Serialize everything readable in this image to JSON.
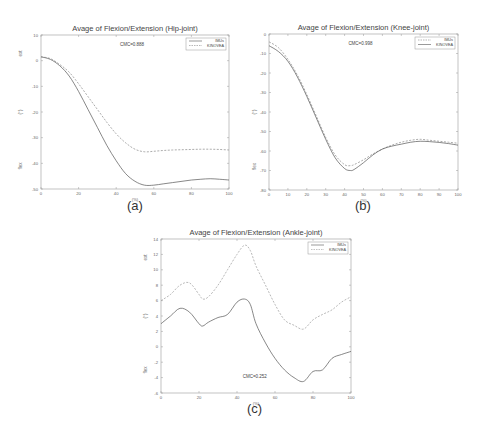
{
  "chart_data": [
    {
      "type": "line",
      "id": "hip",
      "title": "Avage of Flexion/Extension (Hip-joint)",
      "subfigure_label": "(a)",
      "xlabel": "(%)",
      "ylabel_parts": [
        "ext",
        "(°)",
        "flex"
      ],
      "annotation": "CMC=0.888",
      "xlim": [
        0,
        100
      ],
      "ylim": [
        -50,
        10
      ],
      "xticks": [
        0,
        20,
        40,
        60,
        80,
        100
      ],
      "yticks": [
        10,
        0,
        -10,
        -20,
        -30,
        -40,
        -50
      ],
      "grid": false,
      "legend_position": "upper right",
      "x": [
        0,
        5,
        10,
        15,
        20,
        25,
        30,
        35,
        40,
        45,
        50,
        55,
        60,
        65,
        70,
        75,
        80,
        85,
        90,
        95,
        100
      ],
      "series": [
        {
          "name": "IMUs",
          "color": "#555555",
          "dash": "none",
          "values": [
            1.5,
            0.5,
            -2,
            -6,
            -12,
            -19,
            -26,
            -33,
            -39,
            -44,
            -47,
            -48.5,
            -48.5,
            -48,
            -47.5,
            -47,
            -46.5,
            -46.2,
            -46,
            -46.2,
            -46.5
          ]
        },
        {
          "name": "KINOVEA",
          "color": "#888888",
          "dash": "2,1.5",
          "values": [
            1.5,
            0.8,
            -1.5,
            -4.5,
            -9,
            -14,
            -19,
            -24,
            -28.5,
            -32,
            -34.5,
            -35.5,
            -35.3,
            -35,
            -34.8,
            -34.7,
            -34.6,
            -34.5,
            -34.5,
            -34.6,
            -34.8
          ]
        }
      ]
    },
    {
      "type": "line",
      "id": "knee",
      "title": "Avage of Flexion/Extension (Knee-joint)",
      "subfigure_label": "(b)",
      "xlabel": "(%)",
      "ylabel_parts": [
        "(°)",
        "flex"
      ],
      "annotation": "CMC=0.998",
      "xlim": [
        0,
        100
      ],
      "ylim": [
        -80,
        0
      ],
      "xticks": [
        0,
        10,
        20,
        30,
        40,
        50,
        60,
        70,
        80,
        90,
        100
      ],
      "yticks": [
        0,
        -10,
        -20,
        -30,
        -40,
        -50,
        -60,
        -70,
        -80
      ],
      "grid": false,
      "legend_position": "upper right",
      "x": [
        0,
        5,
        10,
        15,
        20,
        25,
        30,
        35,
        40,
        43,
        45,
        50,
        55,
        60,
        65,
        70,
        75,
        80,
        85,
        90,
        95,
        100
      ],
      "series": [
        {
          "name": "IMUs",
          "color": "#888888",
          "dash": "2,1.5",
          "values": [
            -4,
            -7,
            -13,
            -21,
            -31,
            -42,
            -53,
            -62,
            -67,
            -67.5,
            -67,
            -64.5,
            -61.5,
            -59,
            -57,
            -55.5,
            -54.5,
            -54,
            -54.5,
            -55,
            -55.5,
            -56
          ]
        },
        {
          "name": "KINOVEA",
          "color": "#555555",
          "dash": "none",
          "values": [
            -6,
            -9,
            -14,
            -22,
            -32,
            -43,
            -54,
            -63.5,
            -69,
            -70,
            -69.5,
            -66,
            -62,
            -59,
            -57.5,
            -56.5,
            -55.5,
            -55,
            -55.2,
            -55.6,
            -56.2,
            -57
          ]
        }
      ]
    },
    {
      "type": "line",
      "id": "ankle",
      "title": "Avage of Flexion/Extension (Ankle-joint)",
      "subfigure_label": "(c)",
      "xlabel": "(%)",
      "ylabel_parts": [
        "ext",
        "(°)",
        "flex"
      ],
      "annotation": "CMC=0.252",
      "xlim": [
        0,
        100
      ],
      "ylim": [
        -6,
        14
      ],
      "xticks": [
        0,
        20,
        40,
        60,
        80,
        100
      ],
      "yticks": [
        14,
        12,
        10,
        8,
        6,
        4,
        2,
        0,
        -2,
        -4,
        -6
      ],
      "grid": false,
      "legend_position": "upper right",
      "x": [
        0,
        5,
        10,
        15,
        20,
        22,
        25,
        30,
        35,
        40,
        44,
        47,
        50,
        55,
        60,
        65,
        70,
        75,
        80,
        85,
        90,
        95,
        100
      ],
      "series": [
        {
          "name": "IMUs",
          "color": "#555555",
          "dash": "none",
          "values": [
            3,
            4,
            5,
            4.5,
            3,
            2.7,
            3.2,
            3.8,
            4.2,
            5.8,
            6.2,
            5.5,
            3,
            0.5,
            -1.5,
            -3,
            -4,
            -4.5,
            -3.2,
            -3,
            -1.5,
            -1,
            -0.6
          ]
        },
        {
          "name": "KINOVEA",
          "color": "#999999",
          "dash": "2,1.5",
          "values": [
            6,
            6.8,
            8,
            8.3,
            6.8,
            6.2,
            6.5,
            8,
            10,
            12,
            13.2,
            12.5,
            10.5,
            8,
            5.5,
            3.5,
            2.8,
            2.3,
            3.5,
            4.2,
            4.8,
            5.8,
            6.5
          ]
        }
      ]
    }
  ]
}
